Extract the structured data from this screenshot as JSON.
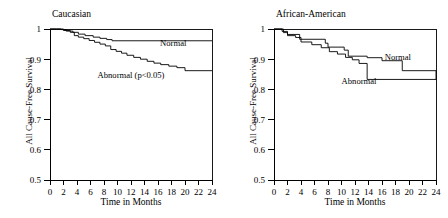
{
  "figure": {
    "background": "#ffffff",
    "line_color": "#000000",
    "width": 448,
    "height": 218
  },
  "chart_data": [
    {
      "type": "line",
      "title": "Caucasian",
      "xlabel": "Time in Months",
      "ylabel": "All Cause-Free Survival",
      "xlim": [
        0,
        24
      ],
      "ylim": [
        0.5,
        1.0
      ],
      "xticks": [
        0,
        2,
        4,
        6,
        8,
        10,
        12,
        14,
        16,
        18,
        20,
        22,
        24
      ],
      "xtick_labels": [
        "0",
        "2",
        "4",
        "6",
        "8",
        "10",
        "12",
        "14",
        "16",
        "18",
        "20",
        "22",
        "24"
      ],
      "yticks": [
        0.5,
        0.6,
        0.7,
        0.8,
        0.9,
        1.0
      ],
      "ytick_labels": [
        "0.5",
        "0.6",
        "0.7",
        "0.8",
        "0.9",
        "1"
      ],
      "grid": false,
      "step_style": "post",
      "legend_position": "inline-annotation",
      "annotations": [
        {
          "text": "Normal",
          "x": 20.2,
          "y": 0.945
        },
        {
          "text": "Abnormal (p<0.05)",
          "x": 12.0,
          "y": 0.838
        }
      ],
      "series": [
        {
          "name": "Normal",
          "label": "Normal",
          "x": [
            0,
            1.0,
            1.6,
            2.4,
            3.4,
            4.2,
            5.2,
            6.4,
            7.4,
            8.4,
            9.2,
            24
          ],
          "y": [
            1.0,
            1.0,
            0.998,
            0.993,
            0.989,
            0.983,
            0.978,
            0.973,
            0.969,
            0.965,
            0.961,
            0.961
          ]
        },
        {
          "name": "Abnormal",
          "label": "Abnormal (p<0.05)",
          "x": [
            0,
            1.0,
            2.0,
            3.0,
            3.6,
            4.2,
            5.0,
            5.8,
            6.6,
            7.4,
            8.2,
            9.0,
            9.8,
            10.6,
            11.4,
            12.4,
            13.4,
            14.4,
            15.4,
            16.4,
            17.6,
            18.8,
            20.0,
            24
          ],
          "y": [
            1.0,
            1.0,
            0.995,
            0.989,
            0.978,
            0.973,
            0.968,
            0.962,
            0.956,
            0.95,
            0.944,
            0.932,
            0.926,
            0.92,
            0.913,
            0.906,
            0.9,
            0.893,
            0.887,
            0.882,
            0.877,
            0.872,
            0.862,
            0.862
          ]
        }
      ]
    },
    {
      "type": "line",
      "title": "African-American",
      "xlabel": "Time in Months",
      "ylabel": "All Cause-Free Survival",
      "xlim": [
        0,
        24
      ],
      "ylim": [
        0.5,
        1.0
      ],
      "xticks": [
        0,
        2,
        4,
        6,
        8,
        10,
        12,
        14,
        16,
        18,
        20,
        22,
        24
      ],
      "xtick_labels": [
        "0",
        "2",
        "4",
        "6",
        "8",
        "10",
        "12",
        "14",
        "16",
        "18",
        "20",
        "22",
        "24"
      ],
      "yticks": [
        0.5,
        0.6,
        0.7,
        0.8,
        0.9,
        1.0
      ],
      "ytick_labels": [
        "0.5",
        "0.6",
        "0.7",
        "0.8",
        "0.9",
        "1"
      ],
      "grid": false,
      "step_style": "post",
      "legend_position": "inline-annotation",
      "annotations": [
        {
          "text": "Normal",
          "x": 16.4,
          "y": 0.898
        },
        {
          "text": "Abnormal",
          "x": 12.6,
          "y": 0.817
        }
      ],
      "series": [
        {
          "name": "Normal",
          "label": "Normal",
          "x": [
            0,
            0.8,
            1.4,
            2.0,
            3.8,
            7.6,
            8.0,
            10.4,
            11.0,
            13.8,
            16.0,
            19.0,
            24
          ],
          "y": [
            1.0,
            1.0,
            0.988,
            0.982,
            0.966,
            0.953,
            0.94,
            0.93,
            0.91,
            0.905,
            0.895,
            0.862,
            0.833
          ]
        },
        {
          "name": "Abnormal",
          "label": "Abnormal",
          "x": [
            0,
            0.6,
            1.2,
            2.0,
            3.2,
            4.0,
            5.6,
            7.0,
            8.2,
            9.4,
            10.6,
            11.6,
            12.6,
            13.8,
            24
          ],
          "y": [
            1.0,
            1.0,
            0.992,
            0.978,
            0.972,
            0.957,
            0.948,
            0.938,
            0.925,
            0.917,
            0.906,
            0.898,
            0.886,
            0.833,
            0.833
          ]
        }
      ]
    }
  ]
}
